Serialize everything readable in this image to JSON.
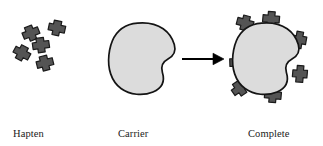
{
  "figure": {
    "background_color": "#ffffff"
  },
  "colors": {
    "hapten_fill": "#545454",
    "hapten_stroke": "#1a1a1a",
    "carrier_fill": "#dcdcdc",
    "carrier_stroke": "#141414",
    "arrow": "#000000",
    "text": "#1a1a1a"
  },
  "labels": {
    "hapten": {
      "line1": "Hapten",
      "line2": "molecules"
    },
    "carrier": {
      "line1": "Carrier",
      "line2": "molecule"
    },
    "antigen": {
      "line1": "Complete",
      "line2": "antigen"
    }
  },
  "arrow": {
    "direction": "right",
    "x_start": 182,
    "x_end": 223,
    "y": 59
  },
  "panels": {
    "hapten_cluster": {
      "count": 5,
      "molecules": [
        {
          "cx": 31,
          "cy": 33,
          "rot": -22
        },
        {
          "cx": 57,
          "cy": 28,
          "rot": 12
        },
        {
          "cx": 41,
          "cy": 45,
          "rot": -8
        },
        {
          "cx": 22,
          "cy": 53,
          "rot": 28
        },
        {
          "cx": 45,
          "cy": 63,
          "rot": -14
        }
      ]
    },
    "carrier_molecule": {
      "bounds": {
        "x": 108,
        "y": 22,
        "w": 68,
        "h": 73
      },
      "shape": "blob-with-notch"
    },
    "complete_antigen": {
      "bounds": {
        "x": 232,
        "y": 22,
        "w": 68,
        "h": 73
      },
      "shape": "blob-with-notch",
      "attached_hapten_count": 7,
      "attached_haptens": [
        {
          "cx": 245,
          "cy": 23,
          "rot": 195
        },
        {
          "cx": 271,
          "cy": 19,
          "rot": 185
        },
        {
          "cx": 299,
          "cy": 40,
          "rot": 100
        },
        {
          "cx": 300,
          "cy": 74,
          "rot": 95
        },
        {
          "cx": 273,
          "cy": 95,
          "rot": 5
        },
        {
          "cx": 240,
          "cy": 88,
          "rot": 325
        },
        {
          "cx": 237,
          "cy": 62,
          "rot": 268
        }
      ]
    }
  }
}
